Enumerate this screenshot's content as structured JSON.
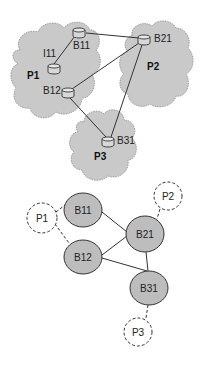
{
  "diagram": {
    "top": {
      "clouds": [
        {
          "id": "P1",
          "label": "P1",
          "label_x": 27,
          "label_y": 79
        },
        {
          "id": "P2",
          "label": "P2",
          "label_x": 147,
          "label_y": 70
        },
        {
          "id": "P3",
          "label": "P3",
          "label_x": 94,
          "label_y": 160
        }
      ],
      "nodes": [
        {
          "id": "B11",
          "label": "B11",
          "cx": 79,
          "cy": 33,
          "label_x": 73,
          "label_y": 49
        },
        {
          "id": "I11",
          "label": "I11",
          "cx": 54,
          "cy": 69,
          "label_x": 43,
          "label_y": 57
        },
        {
          "id": "B12",
          "label": "B12",
          "cx": 68,
          "cy": 93,
          "label_x": 43,
          "label_y": 94
        },
        {
          "id": "B21",
          "label": "B21",
          "cx": 144,
          "cy": 40,
          "label_x": 154,
          "label_y": 42
        },
        {
          "id": "B31",
          "label": "B31",
          "cx": 108,
          "cy": 142,
          "label_x": 117,
          "label_y": 144
        }
      ],
      "links": [
        [
          "I11",
          "B11"
        ],
        [
          "B11",
          "B21"
        ],
        [
          "B12",
          "B21"
        ],
        [
          "B12",
          "B31"
        ],
        [
          "B21",
          "B31"
        ]
      ]
    },
    "bottom": {
      "nodes": [
        {
          "id": "B11",
          "label": "B11",
          "cx": 83,
          "cy": 210
        },
        {
          "id": "B12",
          "label": "B12",
          "cx": 83,
          "cy": 257
        },
        {
          "id": "B21",
          "label": "B21",
          "cx": 145,
          "cy": 234
        },
        {
          "id": "B31",
          "label": "B31",
          "cx": 149,
          "cy": 288
        }
      ],
      "peers": [
        {
          "id": "P1",
          "label": "P1",
          "cx": 42,
          "cy": 218
        },
        {
          "id": "P2",
          "label": "P2",
          "cx": 168,
          "cy": 196
        },
        {
          "id": "P3",
          "label": "P3",
          "cx": 138,
          "cy": 332
        }
      ],
      "links": [
        [
          "B11",
          "B21"
        ],
        [
          "B12",
          "B21"
        ],
        [
          "B12",
          "B31"
        ],
        [
          "B21",
          "B31"
        ]
      ],
      "dashed_links": [
        [
          "P1",
          "B11"
        ],
        [
          "P1",
          "B12"
        ],
        [
          "P2",
          "B21"
        ],
        [
          "P3",
          "B31"
        ]
      ]
    },
    "colors": {
      "cloud_fill": "#c9c9c9",
      "cloud_stroke": "#8a8a8a",
      "node_fill": "#bdbdbd",
      "line": "#333333",
      "peer_fill": "#ffffff"
    }
  }
}
